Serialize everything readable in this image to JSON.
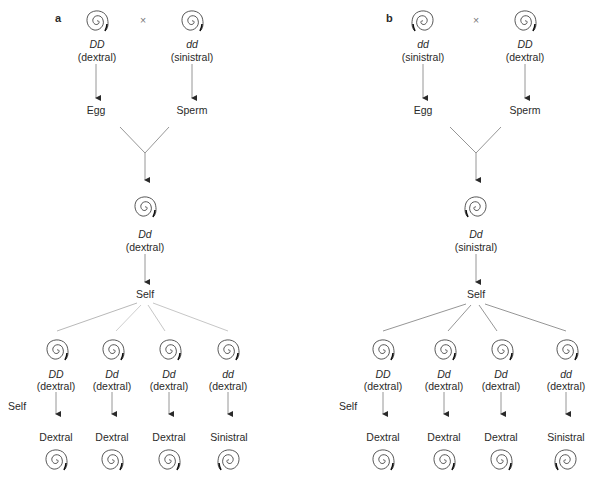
{
  "panels": [
    {
      "label": "a",
      "cross_symbol": "×",
      "parents": [
        {
          "genotype": "DD",
          "phenotype": "(dextral)",
          "gamete": "Egg",
          "coil": "dextral"
        },
        {
          "genotype": "dd",
          "phenotype": "(sinistral)",
          "gamete": "Sperm",
          "coil": "dextral"
        }
      ],
      "f1": {
        "genotype": "Dd",
        "phenotype": "(dextral)",
        "coil": "dextral"
      },
      "self_label": "Self",
      "f2": [
        {
          "genotype": "DD",
          "phenotype": "(dextral)",
          "offspring": "Dextral",
          "coil": "dextral",
          "offspring_coil": "dextral"
        },
        {
          "genotype": "Dd",
          "phenotype": "(dextral)",
          "offspring": "Dextral",
          "coil": "dextral",
          "offspring_coil": "dextral"
        },
        {
          "genotype": "Dd",
          "phenotype": "(dextral)",
          "offspring": "Dextral",
          "coil": "dextral",
          "offspring_coil": "dextral"
        },
        {
          "genotype": "dd",
          "phenotype": "(dextral)",
          "offspring": "Sinistral",
          "coil": "dextral",
          "offspring_coil": "sinistral"
        }
      ],
      "f2_self_label": "Self"
    },
    {
      "label": "b",
      "cross_symbol": "×",
      "parents": [
        {
          "genotype": "dd",
          "phenotype": "(sinistral)",
          "gamete": "Egg",
          "coil": "sinistral"
        },
        {
          "genotype": "DD",
          "phenotype": "(dextral)",
          "gamete": "Sperm",
          "coil": "dextral"
        }
      ],
      "f1": {
        "genotype": "Dd",
        "phenotype": "(sinistral)",
        "coil": "sinistral"
      },
      "self_label": "Self",
      "f2": [
        {
          "genotype": "DD",
          "phenotype": "(dextral)",
          "offspring": "Dextral",
          "coil": "dextral",
          "offspring_coil": "dextral"
        },
        {
          "genotype": "Dd",
          "phenotype": "(dextral)",
          "offspring": "Dextral",
          "coil": "dextral",
          "offspring_coil": "dextral"
        },
        {
          "genotype": "Dd",
          "phenotype": "(dextral)",
          "offspring": "Dextral",
          "coil": "dextral",
          "offspring_coil": "dextral"
        },
        {
          "genotype": "dd",
          "phenotype": "(dextral)",
          "offspring": "Sinistral",
          "coil": "dextral",
          "offspring_coil": "sinistral"
        }
      ],
      "f2_self_label": "Self"
    }
  ]
}
